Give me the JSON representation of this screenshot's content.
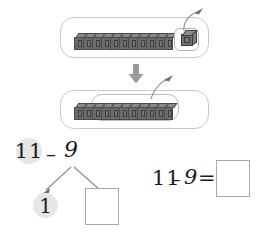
{
  "worksheet": {
    "title": "Subtraction with linking cubes: 11 minus 9",
    "step1": {
      "label": "step-1-panel",
      "train_cubes": 11,
      "highlight_cubes": 1,
      "callout_note": "one cube separated",
      "single_cube_label": "1"
    },
    "step2": {
      "label": "step-2-panel",
      "train_cubes": 11,
      "selected_cubes": 9,
      "callout_note": "nine cubes taken away"
    },
    "transition_arrow": "down-arrow",
    "number_bond": {
      "minuend": "11",
      "operator": "–",
      "subtrahend": "9",
      "branch_left_value": "1",
      "branch_right_value": "",
      "branch_right_placeholder": ""
    },
    "equation": {
      "minuend": "11",
      "minus_sign": "–",
      "subtrahend": "9",
      "equals_sign": "=",
      "answer": "",
      "answer_placeholder": ""
    },
    "colors": {
      "cube_fill": "#6b6b6b",
      "cube_top": "#8a8a8a",
      "cube_outline": "#4a4a4a",
      "panel_border": "#c9c9c9",
      "box_border": "#a8a8a8",
      "highlight_circle": "#e6e6e6",
      "arrow": "#8f8f8f",
      "ink": "#1b1b1b"
    }
  }
}
